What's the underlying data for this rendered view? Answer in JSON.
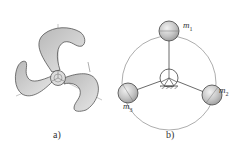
{
  "figure": {
    "panels": [
      {
        "id": "a",
        "caption": "a)",
        "description": "three-blade propeller with central hub",
        "colors": {
          "blade_fill": "#c8c8c8",
          "outline": "#555555",
          "axis": "#9a9a9a"
        }
      },
      {
        "id": "b",
        "caption": "b)",
        "description": "three point masses on rods around a pivot with ground support",
        "masses": [
          {
            "label": "m",
            "sub": "1"
          },
          {
            "label": "m",
            "sub": "2"
          },
          {
            "label": "m",
            "sub": "3"
          }
        ],
        "colors": {
          "ball_fill": "#bdbdbd",
          "outline": "#555555",
          "circle": "#888888"
        }
      }
    ]
  }
}
